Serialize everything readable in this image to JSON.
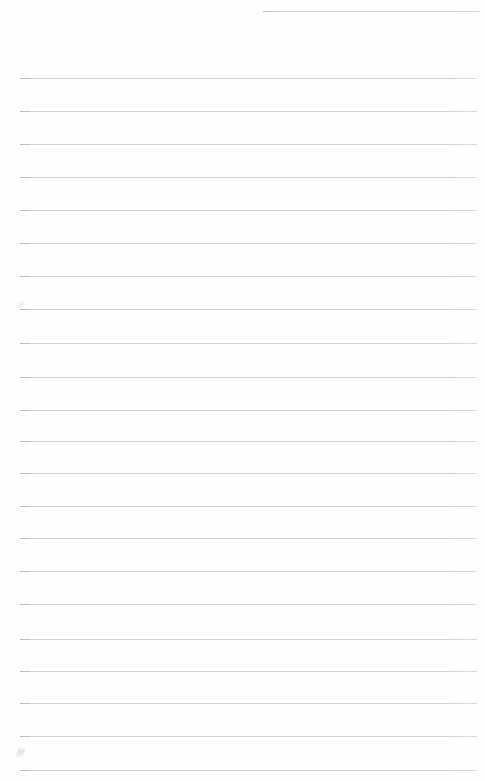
{
  "document": {
    "kind": "scanned-ruled-notebook-page",
    "page_label": "",
    "body_text": "",
    "background_color": "#ffffff",
    "rule_color": "#cfd1d3",
    "rule_cap_color": "#b9bcbe",
    "page_width": 485,
    "page_height": 781
  },
  "ruling": {
    "line_count": 23,
    "spacing_px": 32.5,
    "thickness_px": 1,
    "left_margin_px": 20,
    "right_margin_px": 8,
    "lines": [
      {
        "id": "rule-1",
        "y": 11,
        "x": 263,
        "width": 217,
        "text": ""
      },
      {
        "id": "rule-2",
        "y": 78,
        "x": 20,
        "width": 457,
        "text": ""
      },
      {
        "id": "rule-3",
        "y": 111,
        "x": 20,
        "width": 457,
        "text": ""
      },
      {
        "id": "rule-4",
        "y": 144,
        "x": 20,
        "width": 457,
        "text": ""
      },
      {
        "id": "rule-5",
        "y": 177,
        "x": 20,
        "width": 457,
        "text": ""
      },
      {
        "id": "rule-6",
        "y": 210,
        "x": 20,
        "width": 457,
        "text": ""
      },
      {
        "id": "rule-7",
        "y": 243,
        "x": 20,
        "width": 457,
        "text": ""
      },
      {
        "id": "rule-8",
        "y": 276,
        "x": 20,
        "width": 457,
        "text": ""
      },
      {
        "id": "rule-9",
        "y": 309,
        "x": 20,
        "width": 457,
        "text": ""
      },
      {
        "id": "rule-10",
        "y": 343,
        "x": 20,
        "width": 457,
        "text": ""
      },
      {
        "id": "rule-11",
        "y": 377,
        "x": 20,
        "width": 457,
        "text": ""
      },
      {
        "id": "rule-12",
        "y": 410,
        "x": 20,
        "width": 457,
        "text": ""
      },
      {
        "id": "rule-13",
        "y": 441,
        "x": 20,
        "width": 457,
        "text": ""
      },
      {
        "id": "rule-14",
        "y": 473,
        "x": 20,
        "width": 457,
        "text": ""
      },
      {
        "id": "rule-15",
        "y": 506,
        "x": 20,
        "width": 457,
        "text": ""
      },
      {
        "id": "rule-16",
        "y": 538,
        "x": 20,
        "width": 457,
        "text": ""
      },
      {
        "id": "rule-17",
        "y": 571,
        "x": 20,
        "width": 457,
        "text": ""
      },
      {
        "id": "rule-18",
        "y": 604,
        "x": 20,
        "width": 457,
        "text": ""
      },
      {
        "id": "rule-19",
        "y": 639,
        "x": 20,
        "width": 457,
        "text": ""
      },
      {
        "id": "rule-20",
        "y": 671,
        "x": 20,
        "width": 457,
        "text": ""
      },
      {
        "id": "rule-21",
        "y": 703,
        "x": 20,
        "width": 457,
        "text": ""
      },
      {
        "id": "rule-22",
        "y": 736,
        "x": 20,
        "width": 457,
        "text": ""
      },
      {
        "id": "rule-23",
        "y": 770,
        "x": 20,
        "width": 457,
        "text": ""
      }
    ]
  },
  "artifacts": {
    "smudge_lower_left": "",
    "smudge_mid_left": ""
  }
}
